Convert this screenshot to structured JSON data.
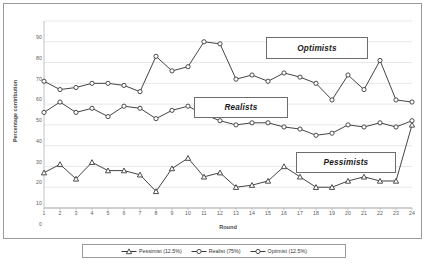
{
  "chart_data": {
    "type": "line",
    "title": "",
    "xlabel": "Round",
    "ylabel": "Percentage contribution",
    "ylim": [
      0,
      90
    ],
    "ytick_step": 10,
    "yticks": [
      "0",
      "10",
      "20",
      "30",
      "40",
      "50",
      "60",
      "70",
      "80",
      "90"
    ],
    "grid": true,
    "grid_axis": "y",
    "legend_position": "bottom",
    "categories": [
      "1",
      "2",
      "3",
      "4",
      "5",
      "6",
      "7",
      "8",
      "9",
      "10",
      "11",
      "12",
      "13",
      "14",
      "15",
      "16",
      "17",
      "18",
      "19",
      "20",
      "21",
      "22",
      "23",
      "24"
    ],
    "series": [
      {
        "name": "Pessimist (12.5%)",
        "marker": "triangle",
        "color": "#3a3a3a",
        "values": [
          17,
          21,
          14,
          22,
          18,
          18,
          16,
          8,
          19,
          24,
          15,
          17,
          10,
          11,
          13,
          20,
          15,
          10,
          10,
          13,
          15,
          13,
          13,
          40
        ]
      },
      {
        "name": "Realist (75%)",
        "marker": "circle",
        "color": "#3a3a3a",
        "values": [
          46,
          51,
          46,
          48,
          44,
          49,
          48,
          43,
          47,
          49,
          45,
          42,
          40,
          41,
          41,
          39,
          38,
          35,
          36,
          40,
          39,
          41,
          39,
          42
        ]
      },
      {
        "name": "Optimist (12.5%)",
        "marker": "circle",
        "color": "#3a3a3a",
        "values": [
          61,
          57,
          58,
          60,
          60,
          59,
          56,
          73,
          66,
          68,
          80,
          79,
          62,
          64,
          61,
          65,
          63,
          60,
          52,
          64,
          57,
          71,
          52,
          51
        ]
      }
    ],
    "annotations": [
      {
        "id": "optimists",
        "text": "Optimists"
      },
      {
        "id": "realists",
        "text": "Realists"
      },
      {
        "id": "pessimists",
        "text": "Pessimists"
      }
    ]
  },
  "legend": {
    "items": [
      {
        "label": "Pessimist (12.5%)",
        "marker": "triangle"
      },
      {
        "label": "Realist (75%)",
        "marker": "circle"
      },
      {
        "label": "Optimist (12.5%)",
        "marker": "circle"
      }
    ]
  }
}
